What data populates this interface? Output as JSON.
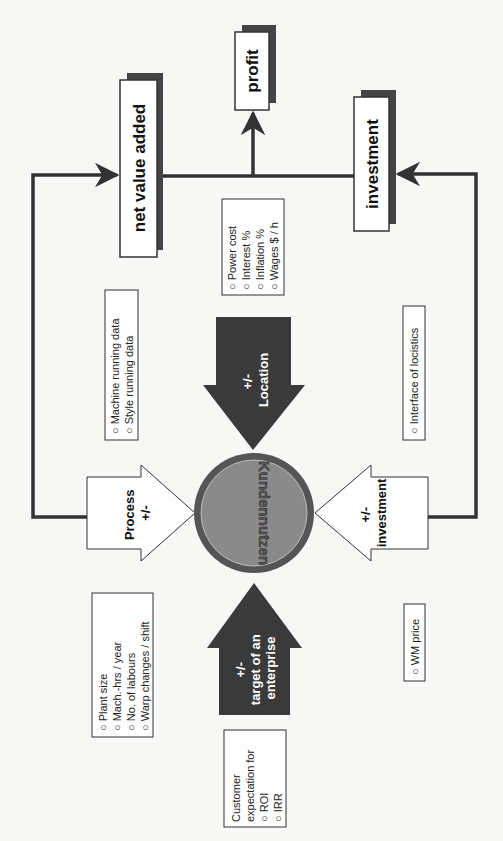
{
  "diagram": {
    "center": {
      "label": "Kundennutzen"
    },
    "outputs": {
      "net_value_added": "net value added",
      "profit": "profit",
      "investment": "investment"
    },
    "arrows": {
      "location": {
        "sign": "+/-",
        "label": "Location"
      },
      "process": {
        "label": "Process",
        "sign": "+/-"
      },
      "investment": {
        "sign": "+/-",
        "label": "investment"
      },
      "target": {
        "sign": "+/-",
        "line1": "target of an",
        "line2": "enterprise"
      }
    },
    "boxes": {
      "costs": {
        "items": [
          "Power cost",
          "Interest %",
          "Inflation %",
          "Wages  $ / h"
        ]
      },
      "running": {
        "items": [
          "Machine running data",
          "Style running data"
        ]
      },
      "plant": {
        "items": [
          "Plant size",
          "Mach.-hrs / year",
          "No. of labours",
          "Warp changes / shift"
        ]
      },
      "customer": {
        "line1": "Customer",
        "line2": "expectation for",
        "items": [
          "ROI",
          "IRR"
        ]
      },
      "logistics": {
        "items": [
          "Interface of  locistics"
        ]
      },
      "wm": {
        "items": [
          "WM price"
        ]
      }
    },
    "bullet": "o",
    "colors": {
      "dark": "#3a3a3a",
      "circle_outer": "#555555",
      "circle_inner": "#8a8a8a",
      "line": "#333333"
    }
  }
}
